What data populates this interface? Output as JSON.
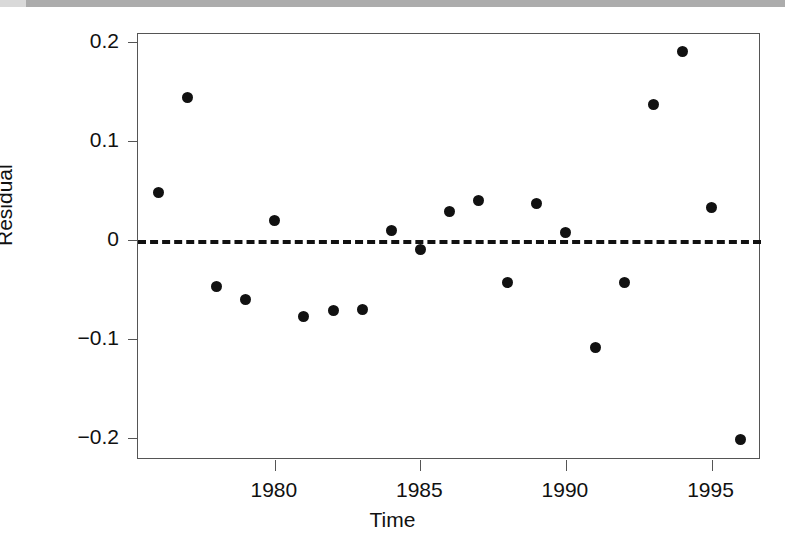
{
  "figure": {
    "background_color": "#ffffff",
    "top_band_color": "#a8a8a8",
    "point_color": "#111111",
    "axis_color": "#555555"
  },
  "chart_data": {
    "type": "scatter",
    "title": "",
    "subtitle": "",
    "xlabel": "Time",
    "ylabel": "Residual",
    "xlim": [
      1975.3,
      1996.7
    ],
    "ylim": [
      -0.222,
      0.208
    ],
    "xticks": [
      1980,
      1985,
      1990,
      1995
    ],
    "xticklabels": [
      "1980",
      "1985",
      "1990",
      "1995"
    ],
    "yticks": [
      0.2,
      0.1,
      0,
      -0.1,
      -0.2
    ],
    "yticklabels": [
      "0.2",
      "0.1",
      "0",
      "-0.1",
      "-0.2"
    ],
    "grid": false,
    "legend": null,
    "annotations": [
      {
        "type": "hline",
        "y": 0,
        "style": "dashed",
        "color": "#111111",
        "label": "zero reference line"
      }
    ],
    "series": [
      {
        "name": "Residual",
        "marker": "filled-circle",
        "color": "#111111",
        "x": [
          1976,
          1977,
          1978,
          1979,
          1980,
          1981,
          1982,
          1983,
          1984,
          1985,
          1986,
          1987,
          1988,
          1989,
          1990,
          1991,
          1992,
          1993,
          1994,
          1995,
          1996
        ],
        "y": [
          0.048,
          0.144,
          -0.047,
          -0.06,
          0.02,
          -0.077,
          -0.071,
          -0.07,
          0.01,
          -0.01,
          0.029,
          0.04,
          -0.043,
          0.037,
          0.008,
          -0.108,
          -0.043,
          0.137,
          0.19,
          0.033,
          -0.201
        ]
      }
    ]
  }
}
